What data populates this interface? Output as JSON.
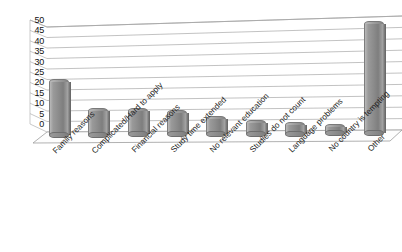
{
  "chart_data": {
    "type": "bar",
    "title": "",
    "subtitle": "",
    "xlabel": "",
    "ylabel": "",
    "ylim": [
      0,
      50
    ],
    "yticks": [
      0,
      5,
      10,
      15,
      20,
      25,
      30,
      35,
      40,
      45,
      50
    ],
    "grid": true,
    "legend": "none",
    "style": "3d-cylinder",
    "bar_color": "#8f8f8f",
    "categories": [
      "Family reasons",
      "Complicated/Hard to apply",
      "Financial reasons",
      "Study time extended",
      "No relevant education",
      "Studies do not count",
      "Language problems",
      "No country is tempting",
      "Other"
    ],
    "values": [
      25,
      11,
      11,
      10,
      7,
      5,
      4,
      3,
      48
    ]
  },
  "axis": {
    "y_tick_labels": [
      "50",
      "45",
      "40",
      "35",
      "30",
      "25",
      "20",
      "15",
      "10",
      "5",
      "0"
    ]
  }
}
